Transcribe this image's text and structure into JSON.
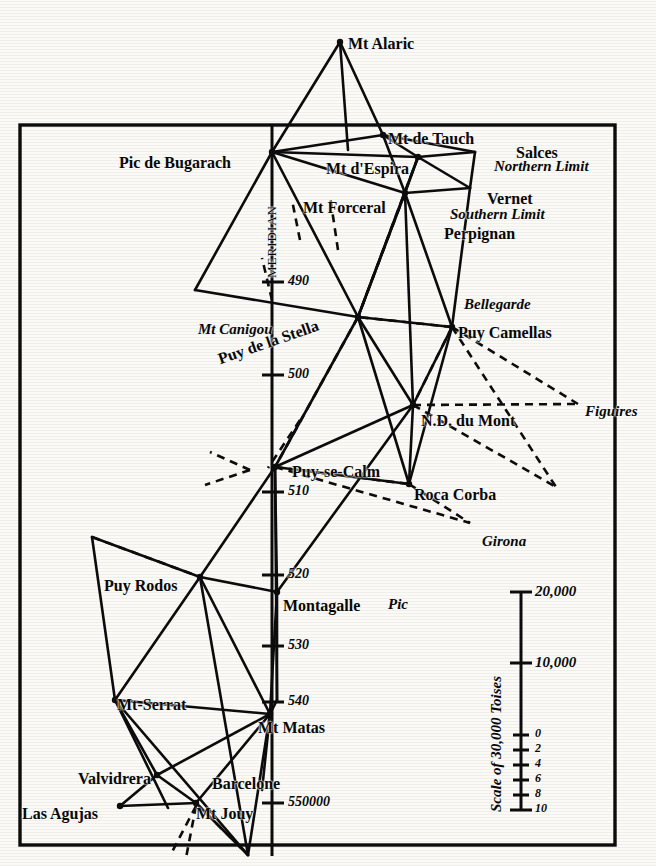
{
  "figure": {
    "kind": "historical-triangulation-map",
    "meridian_label": "MERIDIAN",
    "frame": {
      "x": 20,
      "y": 125,
      "width": 595,
      "height": 720
    }
  },
  "stations": [
    {
      "name": "Mt Alaric",
      "style": "bold",
      "x": 348,
      "y": 36,
      "nx": 340,
      "ny": 42,
      "anchor": "left"
    },
    {
      "name": "Pic de Bugarach",
      "style": "bold",
      "x": 119,
      "y": 155,
      "nx": 272,
      "ny": 152,
      "anchor": "left"
    },
    {
      "name": "Mt de Tauch",
      "style": "bold",
      "x": 388,
      "y": 131,
      "nx": 383,
      "ny": 135,
      "anchor": "left"
    },
    {
      "name": "Mt d'Espira",
      "style": "bold",
      "x": 326,
      "y": 161,
      "nx": 418,
      "ny": 157,
      "anchor": "left"
    },
    {
      "name": "Salces",
      "style": "bold",
      "x": 516,
      "y": 145,
      "nx": null,
      "ny": null,
      "anchor": "left"
    },
    {
      "name": "Northern Limit",
      "style": "italic",
      "x": 494,
      "y": 159,
      "nx": null,
      "ny": null,
      "anchor": "left"
    },
    {
      "name": "Mt Forceral",
      "style": "bold",
      "x": 303,
      "y": 200,
      "nx": 405,
      "ny": 193,
      "anchor": "left"
    },
    {
      "name": "Vernet",
      "style": "bold",
      "x": 487,
      "y": 191,
      "nx": null,
      "ny": null,
      "anchor": "left"
    },
    {
      "name": "Southern Limit",
      "style": "italic",
      "x": 450,
      "y": 207,
      "nx": null,
      "ny": null,
      "anchor": "left"
    },
    {
      "name": "Perpignan",
      "style": "bold",
      "x": 444,
      "y": 226,
      "nx": null,
      "ny": null,
      "anchor": "left"
    },
    {
      "name": "Mt Canigou",
      "style": "italic",
      "x": 198,
      "y": 322,
      "nx": null,
      "ny": null,
      "anchor": "left"
    },
    {
      "name": "Puy de la Stella",
      "style": "bold",
      "x": 216,
      "y": 352,
      "nx": 358,
      "ny": 317,
      "anchor": "left",
      "rotate": -19
    },
    {
      "name": "Bellegarde",
      "style": "italic",
      "x": 464,
      "y": 297,
      "nx": null,
      "ny": null,
      "anchor": "left"
    },
    {
      "name": "Puy Camellas",
      "style": "bold",
      "x": 458,
      "y": 325,
      "nx": 452,
      "ny": 327,
      "anchor": "left"
    },
    {
      "name": "N.D. du Mont",
      "style": "bold",
      "x": 421,
      "y": 413,
      "nx": 413,
      "ny": 405,
      "anchor": "left"
    },
    {
      "name": "Figuires",
      "style": "italic",
      "x": 585,
      "y": 404,
      "nx": null,
      "ny": null,
      "anchor": "left"
    },
    {
      "name": "Puy-se-Calm",
      "style": "bold",
      "x": 292,
      "y": 464,
      "nx": 275,
      "ny": 467,
      "anchor": "left"
    },
    {
      "name": "Roca Corba",
      "style": "bold",
      "x": 414,
      "y": 487,
      "nx": 409,
      "ny": 484,
      "anchor": "left"
    },
    {
      "name": "Girona",
      "style": "italic",
      "x": 482,
      "y": 534,
      "nx": null,
      "ny": null,
      "anchor": "left"
    },
    {
      "name": "Puy Rodos",
      "style": "bold",
      "x": 104,
      "y": 578,
      "nx": 200,
      "ny": 577,
      "anchor": "left"
    },
    {
      "name": "Montagalle",
      "style": "bold",
      "x": 283,
      "y": 598,
      "nx": 277,
      "ny": 592,
      "anchor": "left"
    },
    {
      "name": "Pic",
      "style": "italic",
      "x": 388,
      "y": 597,
      "nx": null,
      "ny": null,
      "anchor": "left"
    },
    {
      "name": "Mt-Serrat",
      "style": "bold",
      "x": 117,
      "y": 697,
      "nx": 115,
      "ny": 700,
      "anchor": "left"
    },
    {
      "name": "Mt Matas",
      "style": "bold",
      "x": 258,
      "y": 720,
      "nx": 270,
      "ny": 714,
      "anchor": "left"
    },
    {
      "name": "Valvidrera",
      "style": "bold",
      "x": 78,
      "y": 771,
      "nx": 157,
      "ny": 775,
      "anchor": "left"
    },
    {
      "name": "Barcelone",
      "style": "bold",
      "x": 212,
      "y": 776,
      "nx": null,
      "ny": null,
      "anchor": "left"
    },
    {
      "name": "Las Agujas",
      "style": "bold",
      "x": 22,
      "y": 806,
      "nx": 120,
      "ny": 806,
      "anchor": "left"
    },
    {
      "name": "Mt Jouy",
      "style": "bold",
      "x": 196,
      "y": 806,
      "nx": 196,
      "ny": 803,
      "anchor": "left"
    }
  ],
  "meridian_ticks": [
    {
      "label": "490",
      "y": 282
    },
    {
      "label": "500",
      "y": 375
    },
    {
      "label": "510",
      "y": 492
    },
    {
      "label": "520",
      "y": 575
    },
    {
      "label": "530",
      "y": 646
    },
    {
      "label": "540",
      "y": 702
    },
    {
      "label": "550000",
      "y": 803
    }
  ],
  "scale_bar": {
    "title": "Scale of 30,000 Toises",
    "ticks": [
      {
        "label": "20,000",
        "y": 592
      },
      {
        "label": "10,000",
        "y": 663
      },
      {
        "label": "0",
        "y": 735
      },
      {
        "label": "2",
        "y": 750
      },
      {
        "label": "4",
        "y": 765
      },
      {
        "label": "6",
        "y": 780
      },
      {
        "label": "8",
        "y": 795
      },
      {
        "label": "10",
        "y": 810
      }
    ]
  },
  "colors": {
    "ink": "#080808",
    "paper": "#fbfaf7"
  }
}
